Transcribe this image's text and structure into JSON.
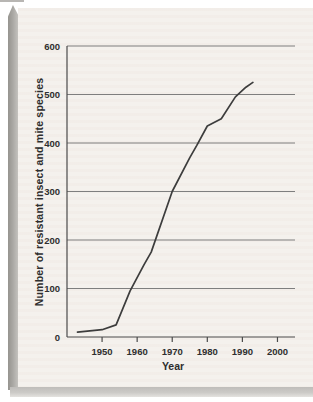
{
  "figure": {
    "panel_color": "#f4f1ed",
    "edge_color": "#96948f",
    "shadow_color": "#bfbdba"
  },
  "chart_data": {
    "type": "line",
    "title": "",
    "xlabel": "Year",
    "ylabel": "Number of resistant insect and mite species",
    "xlim": [
      1940,
      2005
    ],
    "ylim": [
      0,
      600
    ],
    "x_ticks": [
      1950,
      1960,
      1970,
      1980,
      1990,
      2000
    ],
    "y_ticks": [
      0,
      100,
      200,
      300,
      400,
      500,
      600
    ],
    "grid": "horizontal",
    "legend": "none",
    "line_color": "#3d3d3d",
    "grid_color": "#7e7e7e",
    "axis_color": "#4a4a4a",
    "tick_label_color": "#2f2f2f",
    "series": [
      {
        "name": "Resistant insect and mite species",
        "points": [
          [
            1943,
            10
          ],
          [
            1950,
            15
          ],
          [
            1954,
            25
          ],
          [
            1958,
            95
          ],
          [
            1962,
            150
          ],
          [
            1964,
            175
          ],
          [
            1970,
            300
          ],
          [
            1975,
            370
          ],
          [
            1977,
            395
          ],
          [
            1980,
            435
          ],
          [
            1984,
            450
          ],
          [
            1988,
            495
          ],
          [
            1991,
            515
          ],
          [
            1993,
            525
          ]
        ]
      }
    ]
  }
}
